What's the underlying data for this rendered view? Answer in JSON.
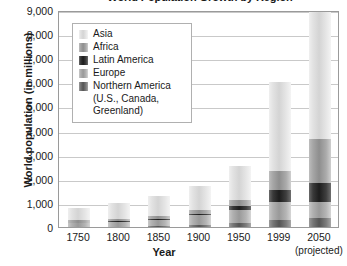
{
  "chart_data": {
    "type": "bar",
    "stacked": true,
    "title": "World Population Growth by Region",
    "xlabel": "Year",
    "ylabel": "World population (in millions)",
    "ylim": [
      0,
      9000
    ],
    "ytick_labels": [
      "0",
      "1,000",
      "2,000",
      "3,000",
      "4,000",
      "5,000",
      "6,000",
      "7,000",
      "8,000",
      "9,000"
    ],
    "ytick_values": [
      0,
      1000,
      2000,
      3000,
      4000,
      5000,
      6000,
      7000,
      8000,
      9000
    ],
    "grid": true,
    "legend_position": "upper-left-inside",
    "categories": [
      "1750",
      "1800",
      "1850",
      "1900",
      "1950",
      "1999",
      "2050"
    ],
    "category_sublabels": [
      "",
      "",
      "",
      "",
      "",
      "",
      "(projected)"
    ],
    "series": [
      {
        "name": "Northern America (U.S., Canada, Greenland)",
        "short": "Northern America",
        "color": "#555555",
        "values": [
          5,
          15,
          30,
          85,
          175,
          310,
          390
        ]
      },
      {
        "name": "Europe",
        "short": "Europe",
        "color": "#999999",
        "values": [
          165,
          190,
          265,
          400,
          545,
          730,
          630
        ]
      },
      {
        "name": "Latin America",
        "short": "Latin America",
        "color": "#1d1d1d",
        "values": [
          15,
          25,
          40,
          75,
          170,
          510,
          810
        ]
      },
      {
        "name": "Africa",
        "short": "Africa",
        "color": "#8e8e8e",
        "values": [
          105,
          105,
          110,
          135,
          225,
          780,
          1830
        ]
      },
      {
        "name": "Asia",
        "short": "Asia",
        "color": "#d4d4d4",
        "values": [
          500,
          670,
          860,
          1020,
          1400,
          3680,
          5270
        ]
      }
    ],
    "totals": [
      790,
      1005,
      1305,
      1715,
      2515,
      6010,
      8930
    ],
    "annotations": []
  },
  "legend": {
    "items": [
      {
        "label": "Asia",
        "swatch": "asia-swatch"
      },
      {
        "label": "Africa",
        "swatch": "africa-swatch"
      },
      {
        "label": "Latin America",
        "swatch": "latin-america-swatch"
      },
      {
        "label": "Europe",
        "swatch": "europe-swatch"
      },
      {
        "label": "Northern America",
        "swatch": "northern-america-swatch"
      }
    ],
    "continuation": [
      "(U.S., Canada,",
      "Greenland)"
    ]
  }
}
